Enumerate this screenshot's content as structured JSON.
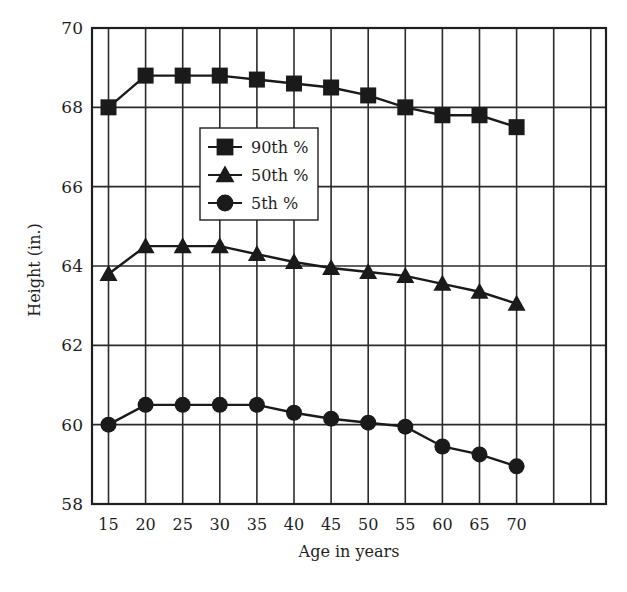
{
  "chart_data": {
    "type": "line",
    "title": "",
    "xlabel": "Age in years",
    "ylabel": "Height (in.)",
    "x": [
      15,
      20,
      25,
      30,
      35,
      40,
      45,
      50,
      55,
      60,
      65,
      70
    ],
    "x_tick_labels": [
      "15",
      "20",
      "25",
      "30",
      "35",
      "40",
      "45",
      "50",
      "55",
      "60",
      "65",
      "70"
    ],
    "y_tick_labels": [
      "58",
      "60",
      "62",
      "64",
      "66",
      "68",
      "70"
    ],
    "ylim": [
      58,
      70
    ],
    "xlim": [
      12.5,
      82.5
    ],
    "y_ticks": [
      58,
      60,
      62,
      64,
      66,
      68,
      70
    ],
    "x_gridlines": [
      15,
      20,
      25,
      30,
      35,
      40,
      45,
      50,
      55,
      60,
      65,
      70,
      75,
      80
    ],
    "grid": true,
    "legend_position": "upper-left-inside",
    "series": [
      {
        "name": "90th %",
        "marker": "square",
        "values": [
          68.0,
          68.8,
          68.8,
          68.8,
          68.7,
          68.6,
          68.5,
          68.3,
          68.0,
          67.8,
          67.8,
          67.5
        ]
      },
      {
        "name": "50th %",
        "marker": "triangle",
        "values": [
          63.8,
          64.5,
          64.5,
          64.5,
          64.3,
          64.1,
          63.95,
          63.85,
          63.75,
          63.55,
          63.35,
          63.05
        ]
      },
      {
        "name": "5th %",
        "marker": "circle",
        "values": [
          60.0,
          60.5,
          60.5,
          60.5,
          60.5,
          60.3,
          60.15,
          60.05,
          59.95,
          59.45,
          59.25,
          58.95
        ]
      }
    ]
  },
  "colors": {
    "ink": "#1a1a1a",
    "grid": "#2b2b2b",
    "background": "#ffffff"
  }
}
